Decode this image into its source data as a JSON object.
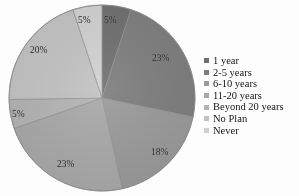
{
  "chart_data": {
    "type": "pie",
    "title": "",
    "categories": [
      "1 year",
      "2-5 years",
      "6-10 years",
      "11-20 years",
      "Beyond 20 years",
      "No Plan",
      "Never"
    ],
    "values": [
      5,
      23,
      18,
      23,
      5,
      20,
      5
    ],
    "value_labels": [
      "5%",
      "23%",
      "18%",
      "23%",
      "5%",
      "20%",
      "5%"
    ],
    "colors": [
      "#6e6e6e",
      "#7d7d7d",
      "#9a9a9a",
      "#a9a9a9",
      "#b4b4b4",
      "#c3c3c3",
      "#d2d2d2"
    ],
    "start_angle_deg": 0,
    "direction": "clockwise",
    "legend_position": "right",
    "grid": false,
    "labels_inside": true
  },
  "legend": {
    "items": [
      {
        "label": "1 year",
        "color": "#6e6e6e"
      },
      {
        "label": "2-5 years",
        "color": "#7d7d7d"
      },
      {
        "label": "6-10 years",
        "color": "#9a9a9a"
      },
      {
        "label": "11-20 years",
        "color": "#a9a9a9"
      },
      {
        "label": "Beyond 20 years",
        "color": "#b4b4b4"
      },
      {
        "label": "No Plan",
        "color": "#c3c3c3"
      },
      {
        "label": "Never",
        "color": "#d2d2d2"
      }
    ]
  },
  "slice_labels": [
    {
      "text": "5%",
      "x": 104,
      "y": 16
    },
    {
      "text": "23%",
      "x": 152,
      "y": 54
    },
    {
      "text": "18%",
      "x": 151,
      "y": 148
    },
    {
      "text": "23%",
      "x": 57,
      "y": 160
    },
    {
      "text": "5%",
      "x": 12,
      "y": 110
    },
    {
      "text": "20%",
      "x": 30,
      "y": 46
    },
    {
      "text": "5%",
      "x": 78,
      "y": 16
    }
  ]
}
